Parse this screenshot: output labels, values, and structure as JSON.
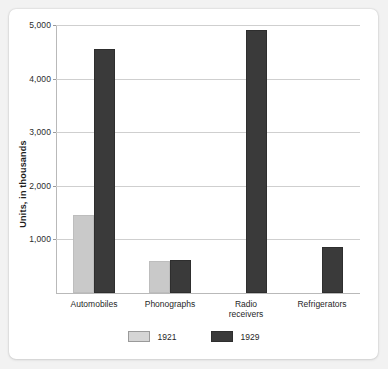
{
  "chart_data": {
    "type": "bar",
    "title": "",
    "xlabel": "",
    "ylabel": "Units, in thousands",
    "ylim": [
      0,
      5000
    ],
    "ytick_labels": [
      "1,000",
      "2,000",
      "3,000",
      "4,000",
      "5,000"
    ],
    "ytick_values": [
      1000,
      2000,
      3000,
      4000,
      5000
    ],
    "grid": true,
    "legend_position": "bottom",
    "categories": [
      "Automobiles",
      "Phonographs",
      "Radio receivers",
      "Refrigerators"
    ],
    "category_lines": [
      [
        "Automobiles"
      ],
      [
        "Phonographs"
      ],
      [
        "Radio",
        "receivers"
      ],
      [
        "Refrigerators"
      ]
    ],
    "series": [
      {
        "name": "1921",
        "color": "#c9c9c9",
        "values": [
          1450,
          600,
          0,
          0
        ]
      },
      {
        "name": "1929",
        "color": "#3a3a3a",
        "values": [
          4550,
          610,
          4900,
          850
        ]
      }
    ]
  },
  "legend": {
    "items": [
      {
        "label": "1921",
        "swatch": "light-gray-swatch"
      },
      {
        "label": "1929",
        "swatch": "dark-gray-swatch"
      }
    ]
  },
  "colors": {
    "series_1921": "#c9c9c9",
    "series_1929": "#3a3a3a",
    "gridline": "#cfcfcf",
    "axis": "#b9b9b9",
    "card_background": "#ffffff",
    "page_background": "#f2f2f2",
    "text": "#1f1f1f"
  }
}
